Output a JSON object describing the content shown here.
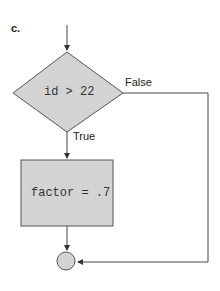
{
  "figure_label": "c.",
  "decision": {
    "text": "id > 22",
    "true_label": "True",
    "false_label": "False"
  },
  "process": {
    "text": "factor = .7"
  },
  "colors": {
    "fill": "#d3d3d3",
    "stroke": "#555555"
  }
}
